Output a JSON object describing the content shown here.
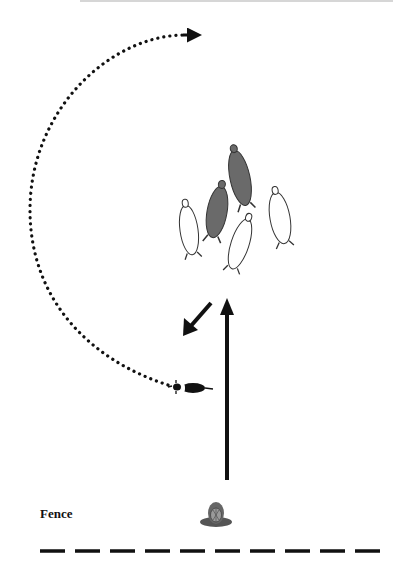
{
  "diagram": {
    "type": "herding-diagram",
    "fence_label": "Fence",
    "caption": "",
    "elements": {
      "sheep": [
        {
          "id": "sheep-dark-1",
          "color": "#6a6a6a",
          "fill": "dark"
        },
        {
          "id": "sheep-dark-2",
          "color": "#6a6a6a",
          "fill": "dark"
        },
        {
          "id": "sheep-white-left",
          "color": "#ffffff",
          "fill": "white"
        },
        {
          "id": "sheep-white-center",
          "color": "#ffffff",
          "fill": "white"
        },
        {
          "id": "sheep-white-right",
          "color": "#ffffff",
          "fill": "white"
        }
      ],
      "dog": {
        "label": "dog",
        "color": "#111111"
      },
      "handler": {
        "label": "handler",
        "color": "#555555"
      },
      "arrows": [
        {
          "id": "outrun-path",
          "style": "dotted",
          "description": "dog circles left around the flock"
        },
        {
          "id": "drive-arrow",
          "style": "solid",
          "description": "handler to flock, straight up"
        },
        {
          "id": "flock-movement-arrow",
          "style": "solid",
          "description": "flock moves down-left"
        }
      ],
      "fence": {
        "style": "dashed",
        "segments": 10
      }
    }
  }
}
